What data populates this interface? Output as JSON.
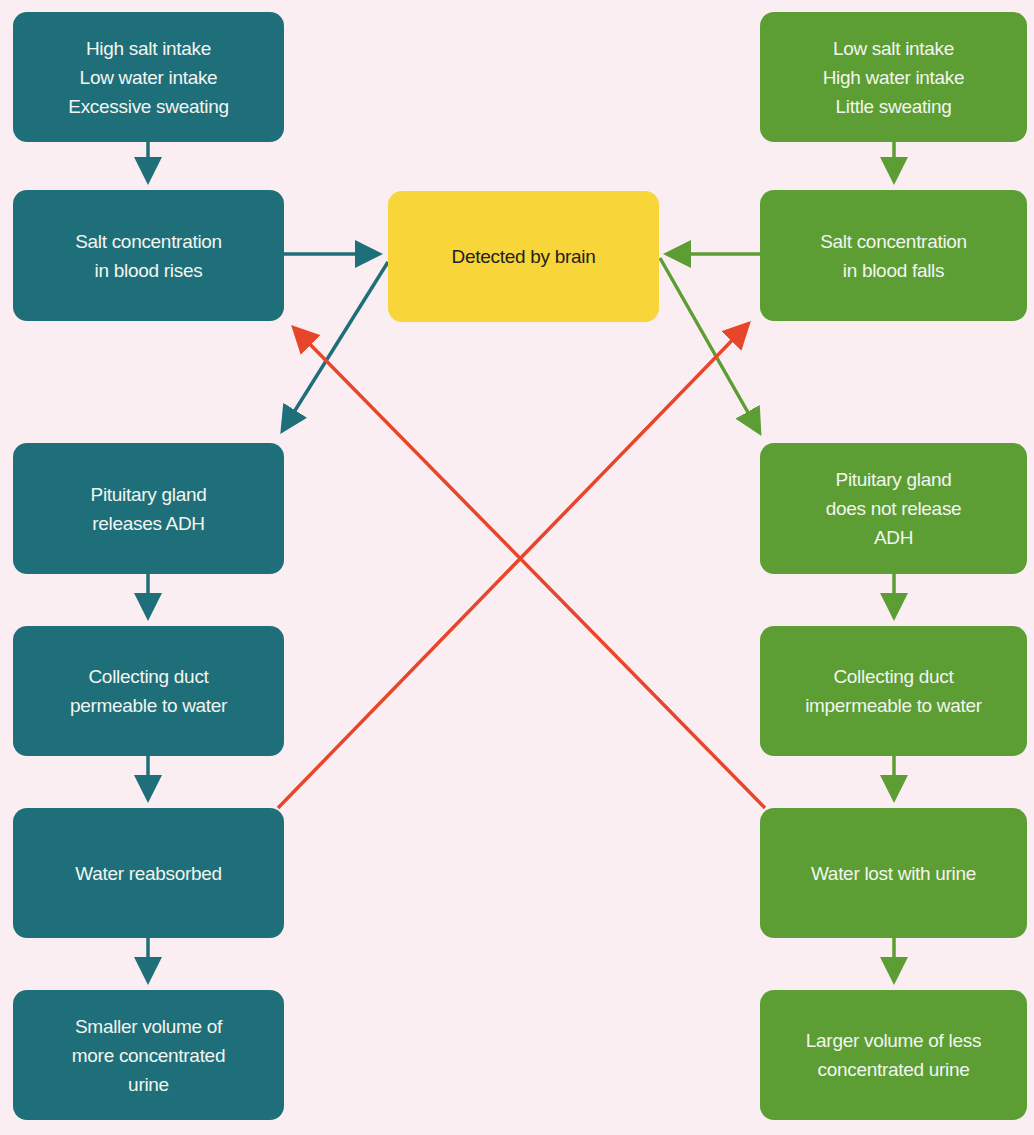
{
  "colors": {
    "background": "#fbeef2",
    "high_salt_path": "#1f6f7a",
    "low_salt_path": "#5c9e33",
    "brain": "#f8d538",
    "feedback_arrows": "#e8462a"
  },
  "center": {
    "label": "Detected by brain"
  },
  "left_column": {
    "boxes": [
      {
        "label": "High salt intake\nLow water intake\nExcessive sweating"
      },
      {
        "label": "Salt concentration\nin blood rises"
      },
      {
        "label": "Pituitary gland\nreleases ADH"
      },
      {
        "label": "Collecting duct\npermeable to water"
      },
      {
        "label": "Water reabsorbed"
      },
      {
        "label": "Smaller volume of\nmore concentrated\nurine"
      }
    ]
  },
  "right_column": {
    "boxes": [
      {
        "label": "Low salt intake\nHigh water intake\nLittle sweating"
      },
      {
        "label": "Salt concentration\nin blood falls"
      },
      {
        "label": "Pituitary gland\ndoes not release\nADH"
      },
      {
        "label": "Collecting duct\nimpermeable to water"
      },
      {
        "label": "Water lost with urine"
      },
      {
        "label": "Larger volume of less\nconcentrated urine"
      }
    ]
  }
}
